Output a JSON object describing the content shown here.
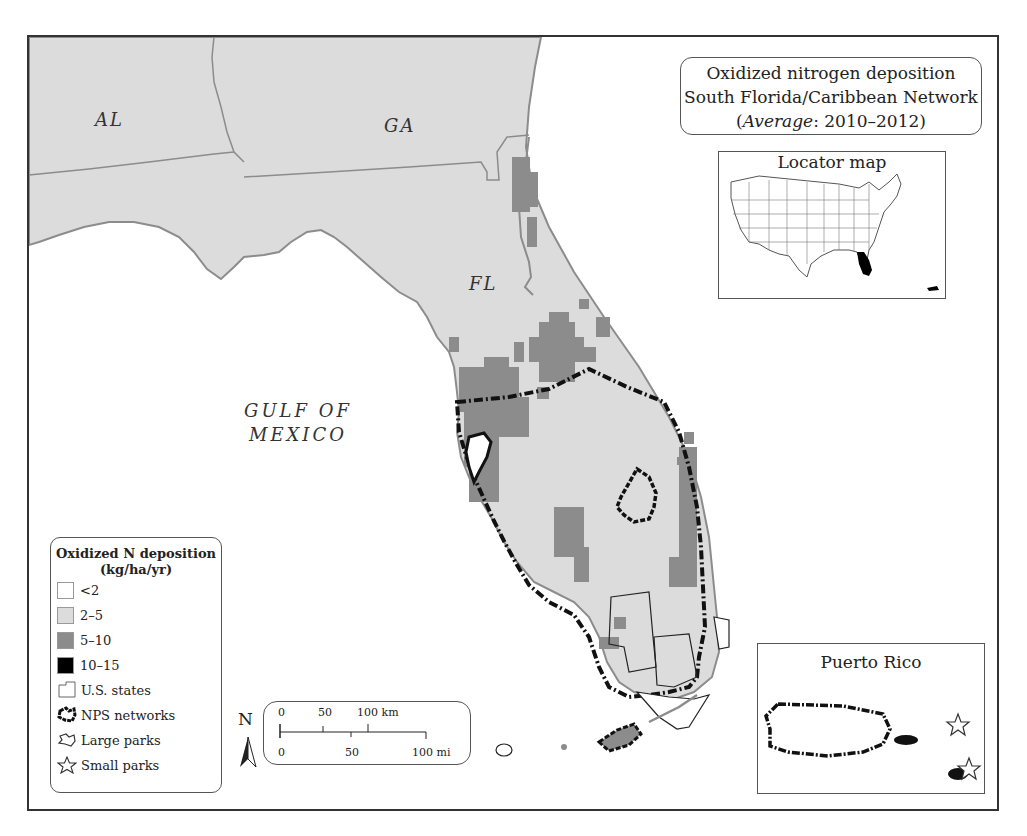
{
  "title": {
    "line1": "Oxidized nitrogen deposition",
    "line2": "South Florida/Caribbean Network",
    "line3_italic": "Average",
    "line3_rest": ": 2010–2012)",
    "line3_open": "("
  },
  "labels": {
    "states": [
      "AL",
      "GA",
      "FL"
    ],
    "water": [
      "GULF OF",
      "MEXICO"
    ]
  },
  "locator_map": {
    "title": "Locator map"
  },
  "puerto_rico_inset": {
    "title": "Puerto Rico"
  },
  "legend": {
    "title_line1": "Oxidized N deposition",
    "title_line2": "(kg/ha/yr)",
    "items": [
      {
        "label": "<2",
        "color": "#ffffff",
        "type": "swatch"
      },
      {
        "label": "2–5",
        "color": "#dcdcdc",
        "type": "swatch"
      },
      {
        "label": "5–10",
        "color": "#8c8c8c",
        "type": "swatch"
      },
      {
        "label": "10–15",
        "color": "#000000",
        "type": "swatch"
      },
      {
        "label": "U.S. states",
        "type": "state-outline-icon"
      },
      {
        "label": "NPS networks",
        "type": "nps-network-icon"
      },
      {
        "label": "Large parks",
        "type": "large-park-icon"
      },
      {
        "label": "Small parks",
        "type": "star-icon"
      }
    ]
  },
  "scale_bar": {
    "km_ticks": [
      "0",
      "50",
      "100 km"
    ],
    "mi_ticks": [
      "0",
      "50",
      "100 mi"
    ]
  },
  "north_arrow": {
    "label": "N"
  },
  "colors": {
    "land_2_5": "#dcdcdc",
    "band_5_10": "#8c8c8c",
    "water": "#ffffff",
    "outline": "#111111"
  }
}
